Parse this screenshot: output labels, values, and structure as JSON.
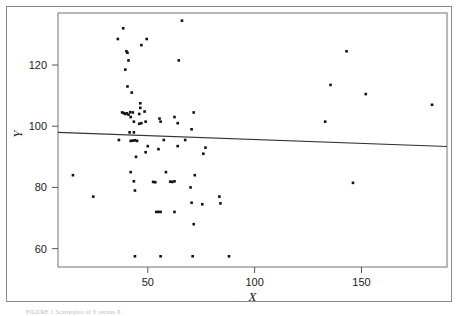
{
  "figure": {
    "caption_prefix": "FIGURE",
    "caption_text": "FIGURE 1   Scatterplot of Y versus X"
  },
  "chart_data": {
    "type": "scatter",
    "title": "",
    "subtitle": "",
    "xlabel": "X",
    "ylabel": "Y",
    "xlim": [
      8,
      190
    ],
    "ylim": [
      54,
      137
    ],
    "xticks": [
      50,
      100,
      150
    ],
    "xtick_labels": [
      "50",
      "100",
      "150"
    ],
    "yticks": [
      60,
      80,
      100,
      120
    ],
    "ytick_labels": [
      "60",
      "80",
      "100",
      "120"
    ],
    "grid": false,
    "legend": null,
    "marker": "square",
    "marker_color": "#111111",
    "marker_size_px": 2.6,
    "points": [
      [
        15.0,
        84.0
      ],
      [
        24.5,
        77.0
      ],
      [
        36.0,
        128.5
      ],
      [
        38.5,
        132.0
      ],
      [
        40.0,
        124.5
      ],
      [
        40.5,
        124.0
      ],
      [
        41.0,
        121.5
      ],
      [
        39.5,
        118.5
      ],
      [
        40.5,
        113.0
      ],
      [
        42.5,
        111.0
      ],
      [
        47.0,
        126.5
      ],
      [
        49.5,
        128.5
      ],
      [
        46.5,
        107.5
      ],
      [
        46.5,
        106.0
      ],
      [
        38.0,
        104.5
      ],
      [
        38.8,
        104.3
      ],
      [
        39.4,
        104.0
      ],
      [
        40.2,
        104.2
      ],
      [
        41.0,
        103.8
      ],
      [
        41.8,
        104.6
      ],
      [
        43.0,
        104.5
      ],
      [
        46.0,
        104.0
      ],
      [
        48.5,
        104.8
      ],
      [
        42.0,
        103.0
      ],
      [
        43.5,
        101.5
      ],
      [
        46.0,
        100.8
      ],
      [
        47.0,
        101.0
      ],
      [
        49.0,
        101.5
      ],
      [
        55.5,
        102.5
      ],
      [
        56.0,
        101.5
      ],
      [
        62.5,
        103.0
      ],
      [
        64.0,
        101.0
      ],
      [
        71.5,
        104.5
      ],
      [
        64.5,
        121.5
      ],
      [
        66.0,
        134.5
      ],
      [
        41.5,
        98.0
      ],
      [
        43.5,
        98.0
      ],
      [
        70.5,
        99.0
      ],
      [
        36.5,
        95.5
      ],
      [
        42.0,
        95.2
      ],
      [
        43.0,
        95.3
      ],
      [
        44.0,
        95.4
      ],
      [
        45.0,
        95.2
      ],
      [
        57.5,
        95.5
      ],
      [
        67.5,
        95.5
      ],
      [
        50.0,
        93.5
      ],
      [
        64.0,
        93.5
      ],
      [
        77.0,
        93.0
      ],
      [
        55.0,
        92.5
      ],
      [
        49.0,
        91.5
      ],
      [
        76.0,
        91.0
      ],
      [
        44.5,
        90.0
      ],
      [
        42.0,
        85.0
      ],
      [
        58.5,
        85.0
      ],
      [
        43.5,
        82.0
      ],
      [
        52.5,
        81.8
      ],
      [
        53.5,
        81.7
      ],
      [
        60.5,
        81.9
      ],
      [
        61.5,
        81.8
      ],
      [
        62.5,
        82.0
      ],
      [
        70.0,
        80.0
      ],
      [
        44.0,
        79.0
      ],
      [
        72.0,
        84.0
      ],
      [
        75.5,
        74.5
      ],
      [
        70.5,
        75.0
      ],
      [
        83.5,
        77.0
      ],
      [
        84.0,
        74.8
      ],
      [
        54.0,
        72.0
      ],
      [
        55.0,
        72.0
      ],
      [
        56.0,
        72.0
      ],
      [
        62.5,
        72.0
      ],
      [
        71.5,
        68.0
      ],
      [
        44.0,
        57.5
      ],
      [
        56.0,
        57.5
      ],
      [
        71.0,
        57.5
      ],
      [
        88.0,
        57.5
      ],
      [
        133.0,
        101.5
      ],
      [
        135.5,
        113.5
      ],
      [
        143.0,
        124.5
      ],
      [
        146.0,
        81.5
      ],
      [
        152.0,
        110.5
      ],
      [
        183.0,
        107.0
      ]
    ],
    "trendline": {
      "label": "least-squares fit",
      "x": [
        8,
        190
      ],
      "y": [
        98.0,
        93.4
      ],
      "color": "#333333"
    }
  }
}
